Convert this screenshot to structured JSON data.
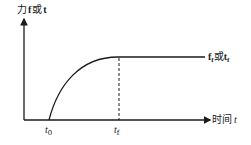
{
  "diagram": {
    "y_axis_label_prefix": "力",
    "y_axis_label_var1": "f",
    "y_axis_label_or": "或",
    "y_axis_label_var2": "t",
    "x_axis_label_text": "时间",
    "x_axis_label_var": "t",
    "curve_label_var1": "f",
    "curve_label_sub1": "f",
    "curve_label_or": "或",
    "curve_label_var2": "t",
    "curve_label_sub2": "f",
    "tick_t0_var": "t",
    "tick_t0_sub": "0",
    "tick_tf_var": "t",
    "tick_tf_sub": "f",
    "colors": {
      "line": "#1a1a1a",
      "text": "#222222"
    }
  }
}
